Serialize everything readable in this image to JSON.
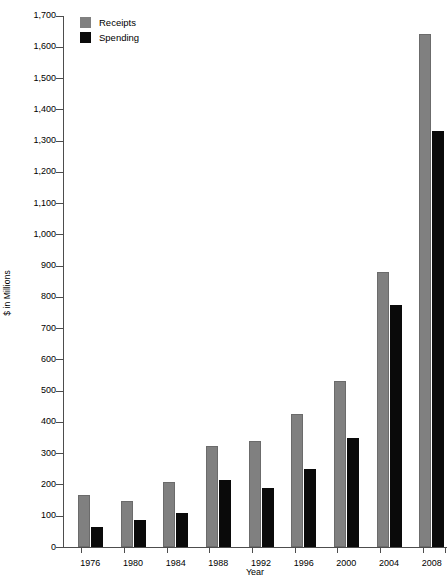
{
  "chart_data": {
    "type": "bar",
    "title": "",
    "xlabel": "Year",
    "ylabel": "$ in Millions",
    "categories": [
      "1976",
      "1980",
      "1984",
      "1988",
      "1992",
      "1996",
      "2000",
      "2004",
      "2008"
    ],
    "series": [
      {
        "name": "Receipts",
        "color": "#808080",
        "values": [
          165,
          148,
          208,
          322,
          338,
          425,
          530,
          880,
          1640
        ]
      },
      {
        "name": "Spending",
        "color": "#0a0a0a",
        "values": [
          65,
          88,
          108,
          215,
          190,
          248,
          350,
          775,
          1330
        ]
      }
    ],
    "ylim": [
      0,
      1700
    ],
    "ytick_step": 100,
    "yticks": [
      "1,700",
      "1,600",
      "1,500",
      "1,400",
      "1,300",
      "1,200",
      "1,100",
      "1,000",
      "900",
      "800",
      "700",
      "600",
      "500",
      "400",
      "300",
      "200",
      "100",
      "0"
    ],
    "ytick_values": [
      1700,
      1600,
      1500,
      1400,
      1300,
      1200,
      1100,
      1000,
      900,
      800,
      700,
      600,
      500,
      400,
      300,
      200,
      100,
      0
    ],
    "grid": false,
    "legend_position": "top-left"
  },
  "axes": {
    "y_title": "$ in Millions",
    "x_title": "Year"
  },
  "legend": {
    "entries": [
      {
        "label": "Receipts",
        "color": "#808080"
      },
      {
        "label": "Spending",
        "color": "#0a0a0a"
      }
    ]
  }
}
